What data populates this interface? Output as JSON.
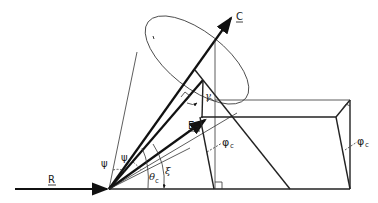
{
  "diagram": {
    "type": "vector geometry figure (cone about axis C with projections)",
    "labels": {
      "C": "C",
      "R": "R",
      "E2": "E",
      "E2_sub": "2",
      "gamma": "γ",
      "psi_outer": "ψ",
      "psi_inner": "ψ",
      "theta": "θ",
      "theta_sub": "c",
      "xi": "ξ",
      "phi_mid": "φ",
      "phi_mid_sub": "c",
      "phi_right": "φ",
      "phi_right_sub": "c"
    },
    "colors": {
      "background": "#ffffff",
      "ink": "#111111"
    }
  }
}
